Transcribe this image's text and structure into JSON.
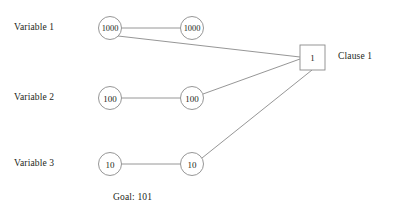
{
  "figure": {
    "background_color": "#ffffff",
    "stroke_color": "#8a8a8a",
    "text_color": "#231f20",
    "goal_text": "Goal: 101"
  },
  "variables": [
    {
      "label": "Variable 1",
      "label_x": 14,
      "label_y": 22,
      "row_y": 28,
      "nodes": [
        {
          "value": "1000",
          "cx": 110,
          "cy": 28,
          "r": 11.5
        },
        {
          "value": "1000",
          "cx": 192,
          "cy": 28,
          "r": 11.5
        }
      ]
    },
    {
      "label": "Variable 2",
      "label_x": 14,
      "label_y": 92,
      "row_y": 98,
      "nodes": [
        {
          "value": "100",
          "cx": 110,
          "cy": 98,
          "r": 11.5
        },
        {
          "value": "100",
          "cx": 192,
          "cy": 98,
          "r": 11.5
        }
      ]
    },
    {
      "label": "Variable 3",
      "label_x": 14,
      "label_y": 158,
      "row_y": 164,
      "nodes": [
        {
          "value": "10",
          "cx": 110,
          "cy": 164,
          "r": 11.5
        },
        {
          "value": "10",
          "cx": 192,
          "cy": 164,
          "r": 11.5
        }
      ]
    }
  ],
  "clause": {
    "value": "1",
    "label": "Clause 1",
    "label_x": 338,
    "label_y": 51,
    "rect": {
      "x": 300,
      "y": 45,
      "width": 25,
      "height": 25
    }
  },
  "edges": [
    {
      "name": "variable-1-pair-edge",
      "x1": 121.5,
      "y1": 28,
      "x2": 180.5,
      "y2": 28
    },
    {
      "name": "variable-2-pair-edge",
      "x1": 121.5,
      "y1": 98,
      "x2": 180.5,
      "y2": 98
    },
    {
      "name": "variable-3-pair-edge",
      "x1": 121.5,
      "y1": 164,
      "x2": 180.5,
      "y2": 164
    },
    {
      "name": "variable-1-clause-edge",
      "x1": 118,
      "y1": 36,
      "x2": 300,
      "y2": 57
    },
    {
      "name": "variable-2-clause-edge",
      "x1": 203,
      "y1": 94,
      "x2": 300,
      "y2": 59
    },
    {
      "name": "variable-3-clause-edge",
      "x1": 202,
      "y1": 158,
      "x2": 312,
      "y2": 70
    }
  ],
  "goal": {
    "text": "Goal: 101",
    "x": 113,
    "y": 192
  }
}
